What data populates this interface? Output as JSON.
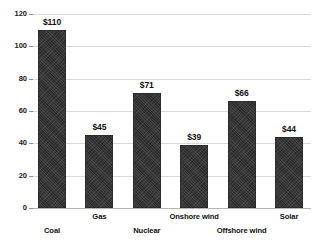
{
  "chart_data": {
    "type": "bar",
    "title": "",
    "subtitle": "",
    "xlabel": "",
    "ylabel": "",
    "categories": [
      "Coal",
      "Gas",
      "Nuclear",
      "Onshore wind",
      "Offshore wind",
      "Solar"
    ],
    "values": [
      110,
      45,
      71,
      39,
      66,
      44
    ],
    "data_labels": [
      "$110",
      "$45",
      "$71",
      "$39",
      "$66",
      "$44"
    ],
    "ylim": [
      0,
      120
    ],
    "yticks": [
      0,
      20,
      40,
      60,
      80,
      100,
      120
    ],
    "ytick_labels": [
      "0",
      "20",
      "40",
      "60",
      "80",
      "100",
      "120"
    ],
    "grid": true,
    "legend": false,
    "legend_position": "none",
    "bar_color": "#2b2b2b",
    "gridline_color": "#d9d9d9",
    "background_color": "#ffffff",
    "label_stagger": [
      "low",
      "high",
      "low",
      "high",
      "low",
      "high"
    ]
  }
}
